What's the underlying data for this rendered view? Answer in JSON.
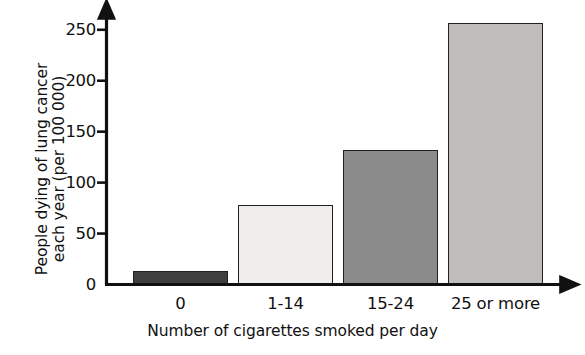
{
  "chart_data": {
    "type": "bar",
    "title": "",
    "subtitle": "",
    "categories": [
      "0",
      "1-14",
      "15-24",
      "25 or more"
    ],
    "values": [
      13,
      78,
      132,
      256
    ],
    "xlabel": "Number of cigarettes smoked per day",
    "ylabel": "People dying of lung cancer each year (per 100 000)",
    "ylabel_lines": [
      "People dying of lung cancer",
      "each year (per 100 000)"
    ],
    "ylim": [
      0,
      265
    ],
    "yticks": [
      0,
      50,
      100,
      150,
      200,
      250
    ],
    "ytick_labels": [
      "0",
      "50",
      "100",
      "150",
      "200",
      "250"
    ],
    "grid": false,
    "legend": false,
    "legend_position": "none",
    "bar_colors": [
      "#3f3f3f",
      "#eeedec",
      "#8b8b8b",
      "#bebdbc"
    ],
    "bar_edge_color": "#20211f",
    "axis_color": "#111111",
    "background": "#ffffff",
    "bars": [
      {
        "category": "0",
        "value": 13,
        "color": "#3f3f3f"
      },
      {
        "category": "1-14",
        "value": 78,
        "color": "#eeedec"
      },
      {
        "category": "15-24",
        "value": 132,
        "color": "#8b8b8b"
      },
      {
        "category": "25 or more",
        "value": 256,
        "color": "#bebdbc"
      }
    ]
  }
}
